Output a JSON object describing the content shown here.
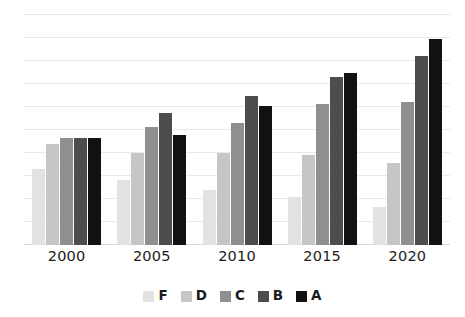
{
  "chart_data": {
    "type": "bar",
    "title": "",
    "subtitle": "",
    "xlabel": "",
    "ylabel": "",
    "categories": [
      "2000",
      "2005",
      "2010",
      "2015",
      "2020"
    ],
    "series": [
      {
        "name": "F",
        "color": "#e2e2e2",
        "values": [
          3.6,
          3.1,
          2.6,
          2.3,
          1.8
        ]
      },
      {
        "name": "D",
        "color": "#c6c6c6",
        "values": [
          4.8,
          4.4,
          4.4,
          4.3,
          3.9
        ]
      },
      {
        "name": "C",
        "color": "#8f8f8f",
        "values": [
          5.1,
          5.6,
          5.8,
          6.7,
          6.8
        ]
      },
      {
        "name": "B",
        "color": "#4d4d4d",
        "values": [
          5.1,
          6.3,
          7.1,
          8.0,
          9.0
        ]
      },
      {
        "name": "A",
        "color": "#111111",
        "values": [
          5.1,
          5.25,
          6.6,
          8.2,
          9.8
        ]
      }
    ],
    "ylim": [
      0,
      11
    ],
    "grid": true,
    "gridline_count": 11,
    "gridline_color": "#e9e9e9",
    "legend_position": "bottom",
    "legend_entries": [
      "F",
      "D",
      "C",
      "B",
      "A"
    ],
    "background_color": "#ffffff",
    "axis_label_color": "#1b1b1b"
  },
  "legend": {
    "items": [
      {
        "label": "F"
      },
      {
        "label": "D"
      },
      {
        "label": "C"
      },
      {
        "label": "B"
      },
      {
        "label": "A"
      }
    ]
  },
  "x_axis": {
    "ticks": [
      "2000",
      "2005",
      "2010",
      "2015",
      "2020"
    ]
  }
}
